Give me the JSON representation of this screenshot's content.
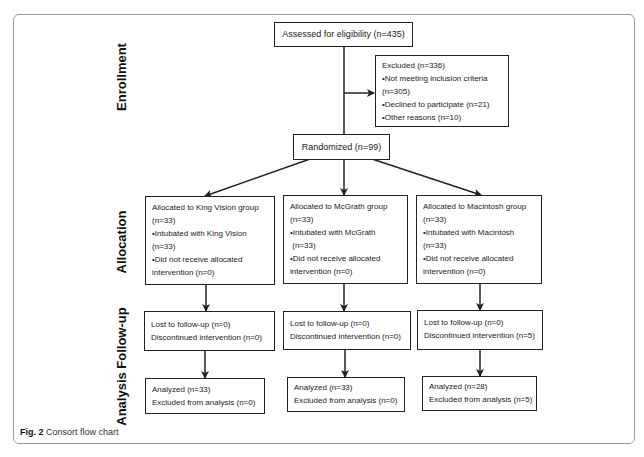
{
  "figure": {
    "caption_label": "Fig. 2",
    "caption_text": "Consort flow chart"
  },
  "stages": {
    "enrollment": "Enrollment",
    "allocation": "Allocation",
    "follow_up": "Follow-up",
    "analysis": "Analysis"
  },
  "enrollment": {
    "assessed": "Assessed for eligibility (n=435)",
    "excluded": {
      "lines": [
        "Excluded (n=336)",
        "•Not meeting inclusion criteria",
        "(n=305)",
        "•Declined to participate (n=21)",
        "•Other reasons (n=10)"
      ]
    },
    "randomized": "Randomized (n=99)"
  },
  "groups": [
    {
      "name": "King Vision",
      "allocation": [
        "Allocated to King Vision group",
        "(n=33)",
        "•Intubated with King Vision",
        "(n=33)",
        "•Did not receive allocated",
        "intervention (n=0)"
      ],
      "follow_up": [
        "Lost to follow-up (n=0)",
        "Discontinued intervention (n=0)"
      ],
      "analysis": [
        "Analyzed (n=33)",
        "Excluded from analysis (n=0)"
      ]
    },
    {
      "name": "McGrath",
      "allocation": [
        "Allocated to McGrath group",
        "(n=33)",
        "•Intubated with McGrath",
        " (n=33)",
        "•Did not receive allocated",
        "intervention (n=0)"
      ],
      "follow_up": [
        "Lost to follow-up (n=0)",
        "Discontinued intervention (n=0)"
      ],
      "analysis": [
        "Analyzed (n=33)",
        "Excluded from analysis (n=0)"
      ]
    },
    {
      "name": "Macintosh",
      "allocation": [
        "Allocated to Macintosh group",
        "(n=33)",
        "•Intubated with Macintosh",
        "(n=33)",
        "•Did not receive allocated",
        "intervention (n=0)"
      ],
      "follow_up": [
        "Lost to follow-up (n=0)",
        "Discontinued intervention (n=5)"
      ],
      "analysis": [
        "Analyzed (n=28)",
        "Excluded from analysis (n=5)"
      ]
    }
  ]
}
